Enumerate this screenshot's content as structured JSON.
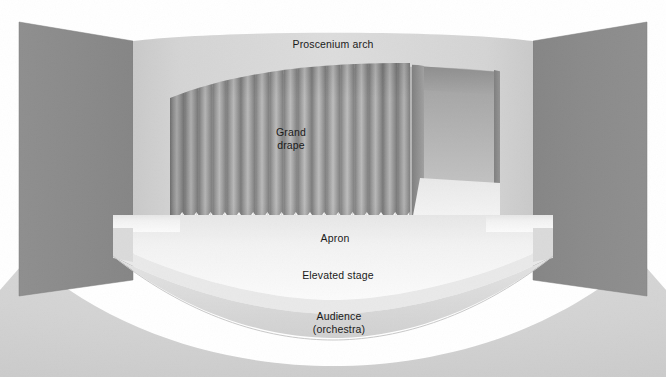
{
  "diagram": {
    "labels": {
      "proscenium_arch": "Proscenium arch",
      "grand_drape": "Grand\ndrape",
      "apron": "Apron",
      "elevated_stage": "Elevated stage",
      "audience": "Audience\n(orchestra)"
    },
    "colors": {
      "side_wall": "#8a8a8a",
      "proscenium_face": "#d6d6d6",
      "proscenium_face_dark": "#c6c6c6",
      "curtain_light": "#b4b4b4",
      "curtain_dark": "#808080",
      "opening_interior": "#9a9a9a",
      "opening_interior_light": "#b8b8b8",
      "stage_floor": "#f4f4f4",
      "apron_top": "#f0f0f0",
      "stage_front_face": "#dcdcdc",
      "audience_floor": "#d2d2d2",
      "label_text": "#1a1a1a",
      "background": "#ffffff"
    },
    "regions": [
      {
        "name": "left-side-wall",
        "type": "wall"
      },
      {
        "name": "right-side-wall",
        "type": "wall"
      },
      {
        "name": "proscenium-wall",
        "type": "wall"
      },
      {
        "name": "stage-opening",
        "type": "opening"
      },
      {
        "name": "grand-drape-curtain",
        "type": "curtain",
        "pleat_count": 17
      },
      {
        "name": "apron-platform",
        "type": "floor"
      },
      {
        "name": "elevated-stage-face",
        "type": "riser"
      },
      {
        "name": "audience-orchestra-floor",
        "type": "floor"
      }
    ]
  }
}
